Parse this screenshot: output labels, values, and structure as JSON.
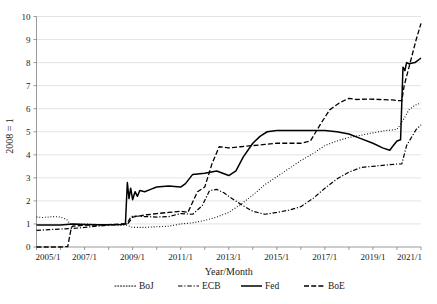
{
  "chart_data": {
    "type": "line",
    "title": "",
    "xlabel": "Year/Month",
    "ylabel": "2008 = 1",
    "xlim": [
      2005.0,
      2021.0
    ],
    "ylim": [
      0,
      10
    ],
    "grid": true,
    "legend_position": "bottom",
    "xtick_labels": [
      "2005/1",
      "2007/1",
      "2009/1",
      "2011/1",
      "2013/1",
      "2015/1",
      "2017/1",
      "2019/1",
      "2021/1"
    ],
    "xtick_values": [
      2005,
      2007,
      2009,
      2011,
      2013,
      2015,
      2017,
      2019,
      2021
    ],
    "ytick_labels": [
      "0",
      "1",
      "2",
      "3",
      "4",
      "5",
      "6",
      "7",
      "8",
      "9",
      "10"
    ],
    "ytick_values": [
      0,
      1,
      2,
      3,
      4,
      5,
      6,
      7,
      8,
      9,
      10
    ],
    "series": [
      {
        "name": "BoJ",
        "style": "dotted",
        "color": "#000000",
        "x": [
          2005.0,
          2005.25,
          2005.5,
          2005.75,
          2006.0,
          2006.25,
          2006.4,
          2006.6,
          2006.8,
          2007.0,
          2007.5,
          2008.0,
          2008.5,
          2008.75,
          2009.0,
          2009.5,
          2010.0,
          2010.5,
          2011.0,
          2011.5,
          2012.0,
          2012.5,
          2013.0,
          2013.5,
          2014.0,
          2014.5,
          2015.0,
          2015.5,
          2016.0,
          2016.5,
          2017.0,
          2017.5,
          2018.0,
          2018.5,
          2019.0,
          2019.5,
          2020.0,
          2020.25,
          2020.5,
          2020.75,
          2021.0
        ],
        "y": [
          1.3,
          1.28,
          1.3,
          1.32,
          1.3,
          1.2,
          1.0,
          1.0,
          1.0,
          1.0,
          0.98,
          0.97,
          0.95,
          0.95,
          0.85,
          0.85,
          0.88,
          0.9,
          1.0,
          1.05,
          1.15,
          1.3,
          1.5,
          1.85,
          2.25,
          2.7,
          3.05,
          3.4,
          3.75,
          4.05,
          4.4,
          4.6,
          4.75,
          4.85,
          4.95,
          5.05,
          5.1,
          5.5,
          5.95,
          6.15,
          6.25
        ]
      },
      {
        "name": "ECB",
        "style": "dash-dot",
        "color": "#000000",
        "x": [
          2005.0,
          2005.5,
          2006.0,
          2006.5,
          2007.0,
          2007.5,
          2008.0,
          2008.5,
          2008.75,
          2008.9,
          2009.0,
          2009.5,
          2010.0,
          2010.5,
          2011.0,
          2011.5,
          2011.9,
          2012.2,
          2012.5,
          2012.8,
          2013.0,
          2013.5,
          2014.0,
          2014.5,
          2015.0,
          2015.5,
          2016.0,
          2016.5,
          2017.0,
          2017.5,
          2018.0,
          2018.5,
          2019.0,
          2019.5,
          2020.0,
          2020.2,
          2020.4,
          2020.6,
          2020.8,
          2021.0
        ],
        "y": [
          0.72,
          0.75,
          0.78,
          0.8,
          0.85,
          0.9,
          0.95,
          0.97,
          1.0,
          1.25,
          1.35,
          1.32,
          1.3,
          1.32,
          1.45,
          1.42,
          1.8,
          2.45,
          2.5,
          2.35,
          2.2,
          1.85,
          1.55,
          1.42,
          1.5,
          1.6,
          1.75,
          2.1,
          2.55,
          2.95,
          3.25,
          3.45,
          3.5,
          3.55,
          3.6,
          3.6,
          4.4,
          4.75,
          5.1,
          5.3
        ]
      },
      {
        "name": "Fed",
        "style": "solid",
        "color": "#000000",
        "x": [
          2005.0,
          2005.5,
          2006.0,
          2006.5,
          2007.0,
          2007.5,
          2008.0,
          2008.5,
          2008.7,
          2008.78,
          2008.85,
          2008.92,
          2009.0,
          2009.1,
          2009.2,
          2009.3,
          2009.5,
          2009.75,
          2010.0,
          2010.5,
          2011.0,
          2011.2,
          2011.5,
          2012.0,
          2012.5,
          2013.0,
          2013.3,
          2013.6,
          2014.0,
          2014.3,
          2014.6,
          2015.0,
          2015.5,
          2016.0,
          2016.5,
          2017.0,
          2017.5,
          2018.0,
          2018.5,
          2019.0,
          2019.4,
          2019.7,
          2019.85,
          2020.0,
          2020.15,
          2020.25,
          2020.33,
          2020.4,
          2020.5,
          2020.75,
          2021.0
        ],
        "y": [
          0.95,
          0.95,
          0.95,
          1.0,
          0.98,
          0.97,
          0.96,
          0.98,
          1.0,
          2.8,
          2.1,
          2.55,
          2.05,
          2.4,
          2.2,
          2.45,
          2.4,
          2.5,
          2.6,
          2.65,
          2.6,
          2.75,
          3.15,
          3.2,
          3.3,
          3.1,
          3.3,
          3.9,
          4.5,
          4.8,
          5.0,
          5.05,
          5.05,
          5.05,
          5.05,
          5.05,
          5.0,
          4.9,
          4.7,
          4.5,
          4.3,
          4.2,
          4.4,
          4.6,
          4.65,
          7.8,
          7.65,
          8.0,
          7.95,
          8.0,
          8.2
        ]
      },
      {
        "name": "BoE",
        "style": "dashed",
        "color": "#000000",
        "x": [
          2005.0,
          2005.5,
          2006.0,
          2006.3,
          2006.45,
          2006.5,
          2007.0,
          2007.5,
          2008.0,
          2008.5,
          2008.8,
          2009.0,
          2009.3,
          2009.6,
          2010.0,
          2010.5,
          2011.0,
          2011.3,
          2011.7,
          2012.0,
          2012.3,
          2012.6,
          2013.0,
          2013.5,
          2014.0,
          2014.5,
          2015.0,
          2015.5,
          2016.0,
          2016.4,
          2016.8,
          2017.2,
          2017.6,
          2018.0,
          2018.3,
          2018.8,
          2019.3,
          2019.8,
          2020.0,
          2020.2,
          2020.3,
          2020.45,
          2020.6,
          2020.8,
          2021.0
        ],
        "y": [
          0.0,
          0.0,
          0.0,
          0.02,
          0.85,
          0.9,
          0.95,
          0.95,
          0.97,
          1.0,
          1.0,
          1.3,
          1.35,
          1.4,
          1.45,
          1.5,
          1.55,
          1.5,
          2.4,
          2.6,
          3.6,
          4.35,
          4.3,
          4.35,
          4.4,
          4.45,
          4.5,
          4.5,
          4.5,
          4.6,
          5.3,
          5.95,
          6.25,
          6.45,
          6.4,
          6.42,
          6.4,
          6.38,
          6.35,
          6.35,
          7.0,
          7.6,
          8.2,
          9.0,
          9.7
        ]
      }
    ]
  },
  "legend": {
    "items": [
      {
        "label": "BoJ",
        "style": "dotted"
      },
      {
        "label": "ECB",
        "style": "dash-dot"
      },
      {
        "label": "Fed",
        "style": "solid"
      },
      {
        "label": "BoE",
        "style": "dashed"
      }
    ]
  }
}
